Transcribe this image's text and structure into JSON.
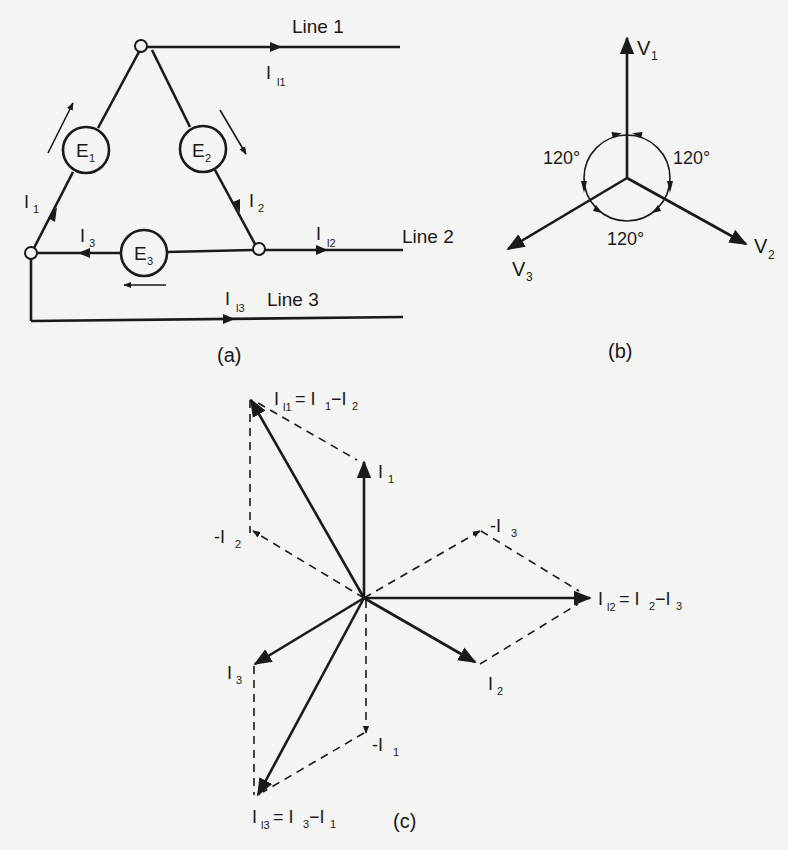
{
  "figure": {
    "panel_a": {
      "caption": "(a)",
      "lines": [
        {
          "label": "Line 1",
          "current": "I",
          "current_sub": "l1"
        },
        {
          "label": "Line 2",
          "current": "I",
          "current_sub": "l2"
        },
        {
          "label": "Line 3",
          "current": "I",
          "current_sub": "l3"
        }
      ],
      "generators": [
        {
          "label": "E",
          "sub": "1"
        },
        {
          "label": "E",
          "sub": "2"
        },
        {
          "label": "E",
          "sub": "3"
        }
      ],
      "phase_currents": [
        {
          "label": "I",
          "sub": "1"
        },
        {
          "label": "I",
          "sub": "2"
        },
        {
          "label": "I",
          "sub": "3"
        }
      ]
    },
    "panel_b": {
      "caption": "(b)",
      "phasors": [
        {
          "label": "V",
          "sub": "1",
          "angle_deg": 90
        },
        {
          "label": "V",
          "sub": "2",
          "angle_deg": -30
        },
        {
          "label": "V",
          "sub": "3",
          "angle_deg": 210
        }
      ],
      "angle_labels": [
        "120°",
        "120°",
        "120°"
      ]
    },
    "panel_c": {
      "caption": "(c)",
      "solid_phasors": [
        {
          "label": "I",
          "sub": "1",
          "angle_deg": 90
        },
        {
          "label": "I",
          "sub": "2",
          "angle_deg": -30
        },
        {
          "label": "I",
          "sub": "3",
          "angle_deg": 210
        }
      ],
      "dashed_phasors": [
        {
          "label": "-I",
          "sub": "1",
          "angle_deg": -90
        },
        {
          "label": "-I",
          "sub": "2",
          "angle_deg": 150
        },
        {
          "label": "-I",
          "sub": "3",
          "angle_deg": 30
        }
      ],
      "line_currents": [
        {
          "label": "I",
          "sub": "l1",
          "eq": "= I",
          "eq_sub1": "1",
          "eq_mid": "−I",
          "eq_sub2": "2"
        },
        {
          "label": "I",
          "sub": "l2",
          "eq": "= I",
          "eq_sub1": "2",
          "eq_mid": "−I",
          "eq_sub2": "3"
        },
        {
          "label": "I",
          "sub": "l3",
          "eq": "= I",
          "eq_sub1": "3",
          "eq_mid": "−I",
          "eq_sub2": "1"
        }
      ]
    }
  }
}
